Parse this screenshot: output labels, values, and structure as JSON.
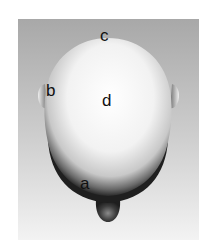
{
  "figure": {
    "labels": {
      "a": "a",
      "b": "b",
      "c": "c",
      "d": "d"
    },
    "colors": {
      "background_top": "#a9a9a9",
      "background_bottom": "#f4f4f4",
      "head_highlight": "#ffffff",
      "head_shadow": "#2a2a2a"
    }
  }
}
